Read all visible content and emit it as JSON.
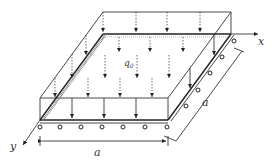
{
  "figure": {
    "labels": {
      "load": "q",
      "load_subscript": "0",
      "x_axis": "x",
      "y_axis": "y",
      "side_bottom": "a",
      "side_right": "a"
    },
    "colors": {
      "line": "#333333",
      "background": "#ffffff"
    },
    "supports": {
      "front_edge_rollers": 6,
      "right_edge_rollers": 5,
      "left_edge": "clamped (hatched)"
    },
    "load_arrows": {
      "front_row_solid": 4,
      "back_row_dashed": 4
    }
  }
}
